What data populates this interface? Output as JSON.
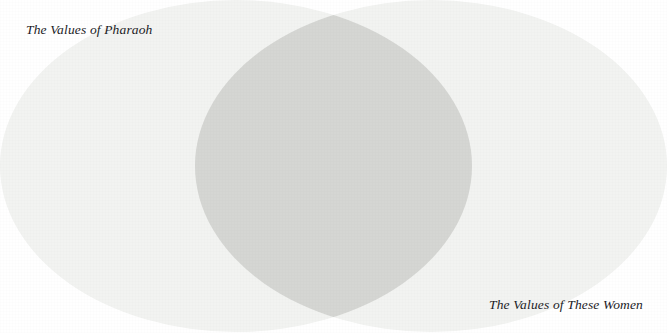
{
  "figure": {
    "type": "venn-diagram",
    "width": 667,
    "height": 333,
    "background_color": "#ffffff"
  },
  "labels": {
    "left": "The Values of Pharaoh",
    "right": "The Values of These Women"
  },
  "chart_data": {
    "type": "venn",
    "title": "",
    "subtitle": "",
    "xlabel": "",
    "ylabel": "",
    "grid": false,
    "legend_position": "none",
    "sets": [
      {
        "name": "The Values of Pharaoh",
        "label_position": "top-left",
        "fill_color": "#f2f3f1",
        "center_x": 236,
        "center_y": 166,
        "radius_x": 236,
        "radius_y": 166
      },
      {
        "name": "The Values of These Women",
        "label_position": "bottom-right",
        "fill_color": "#f2f3f1",
        "center_x": 431,
        "center_y": 166,
        "radius_x": 236,
        "radius_y": 166
      }
    ],
    "intersection": {
      "name": "Shared Values",
      "label": "",
      "fill_color": "#d5d6d3",
      "shape": "lens",
      "left_x": 215,
      "right_x": 462,
      "top_y": 4,
      "bottom_y": 328
    },
    "annotations": [
      {
        "text": "The Values of Pharaoh",
        "x": 26,
        "y": 28,
        "anchor": "start"
      },
      {
        "text": "The Values of These Women",
        "x": 643,
        "y": 311,
        "anchor": "end"
      }
    ]
  },
  "colors": {
    "page_background": "#ffffff",
    "circle_fill": "#f2f3f1",
    "overlap_fill": "#d5d6d3",
    "label_text": "#1b1b1f"
  }
}
